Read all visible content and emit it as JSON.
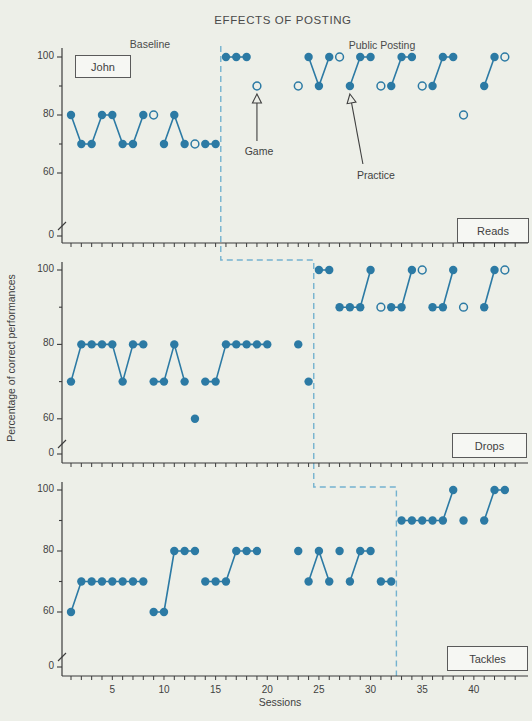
{
  "title": "EFFECTS OF POSTING",
  "subject_label": "John",
  "phase_labels": {
    "baseline": "Baseline",
    "posting": "Public Posting"
  },
  "annotations": {
    "game": "Game",
    "practice": "Practice"
  },
  "axis": {
    "xlabel": "Sessions",
    "ylabel": "Percentage of correct performances"
  },
  "panel_boxes": {
    "reads": "Reads",
    "drops": "Drops",
    "tackles": "Tackles"
  },
  "chart_data": {
    "type": "scatter",
    "title": "EFFECTS OF POSTING",
    "xlabel": "Sessions",
    "ylabel": "Percentage of correct performances",
    "x_tick_labels": [
      5,
      10,
      15,
      20,
      25,
      30,
      35,
      40
    ],
    "x_range": [
      1,
      44
    ],
    "y_tick_values": [
      100,
      90,
      80,
      70,
      60
    ],
    "y_axis_label_values": [
      100,
      80,
      60,
      0
    ],
    "y_axis_break": true,
    "legend": {
      "filled_marker": "session data point",
      "open_marker": "special condition session (game / practice noted)"
    },
    "colors": {
      "data": "#2c7aa4",
      "phase_line": "#74b2cf",
      "axis": "#3b3b3b",
      "text": "#3f3f3f",
      "background": "#edefe8"
    },
    "panels": [
      {
        "label": "Reads",
        "phase_change_after_session": 15.5,
        "segments": [
          [
            [
              1,
              80
            ],
            [
              2,
              70
            ],
            [
              3,
              70
            ],
            [
              4,
              80
            ],
            [
              5,
              80
            ],
            [
              6,
              70
            ],
            [
              7,
              70
            ],
            [
              8,
              80
            ]
          ],
          [
            [
              10,
              70
            ],
            [
              11,
              80
            ],
            [
              12,
              70
            ]
          ],
          [
            [
              14,
              70
            ],
            [
              15,
              70
            ]
          ],
          [
            [
              16,
              100
            ],
            [
              17,
              100
            ],
            [
              18,
              100
            ]
          ],
          [
            [
              24,
              100
            ],
            [
              25,
              90
            ],
            [
              26,
              100
            ]
          ],
          [
            [
              28,
              90
            ],
            [
              29,
              100
            ],
            [
              30,
              100
            ]
          ],
          [
            [
              32,
              90
            ],
            [
              33,
              100
            ],
            [
              34,
              100
            ]
          ],
          [
            [
              36,
              90
            ],
            [
              37,
              100
            ],
            [
              38,
              100
            ]
          ],
          [
            [
              41,
              90
            ],
            [
              42,
              100
            ]
          ]
        ],
        "isolated_filled": [],
        "open_points": [
          [
            9,
            80
          ],
          [
            13,
            70
          ],
          [
            19,
            90
          ],
          [
            23,
            90
          ],
          [
            27,
            100
          ],
          [
            31,
            90
          ],
          [
            35,
            90
          ],
          [
            39,
            80
          ],
          [
            43,
            100
          ]
        ],
        "annotations": [
          {
            "key": "game",
            "target": [
              19,
              90
            ]
          },
          {
            "key": "practice",
            "target": [
              28,
              90
            ]
          }
        ]
      },
      {
        "label": "Drops",
        "phase_change_after_session": 24.5,
        "segments": [
          [
            [
              1,
              70
            ],
            [
              2,
              80
            ],
            [
              3,
              80
            ],
            [
              4,
              80
            ],
            [
              5,
              80
            ],
            [
              6,
              70
            ],
            [
              7,
              80
            ],
            [
              8,
              80
            ]
          ],
          [
            [
              9,
              70
            ],
            [
              10,
              70
            ],
            [
              11,
              80
            ],
            [
              12,
              70
            ]
          ],
          [
            [
              14,
              70
            ],
            [
              15,
              70
            ],
            [
              16,
              80
            ],
            [
              17,
              80
            ],
            [
              18,
              80
            ],
            [
              19,
              80
            ],
            [
              20,
              80
            ]
          ],
          [
            [
              25,
              100
            ],
            [
              26,
              100
            ]
          ],
          [
            [
              27,
              90
            ],
            [
              28,
              90
            ],
            [
              29,
              90
            ],
            [
              30,
              100
            ]
          ],
          [
            [
              32,
              90
            ],
            [
              33,
              90
            ],
            [
              34,
              100
            ]
          ],
          [
            [
              36,
              90
            ],
            [
              37,
              90
            ],
            [
              38,
              100
            ]
          ],
          [
            [
              41,
              90
            ],
            [
              42,
              100
            ]
          ]
        ],
        "isolated_filled": [
          [
            13,
            60
          ],
          [
            23,
            80
          ],
          [
            24,
            70
          ]
        ],
        "open_points": [
          [
            31,
            90
          ],
          [
            35,
            100
          ],
          [
            39,
            90
          ],
          [
            43,
            100
          ]
        ],
        "annotations": []
      },
      {
        "label": "Tackles",
        "phase_change_after_session": 32.5,
        "segments": [
          [
            [
              1,
              60
            ],
            [
              2,
              70
            ],
            [
              3,
              70
            ],
            [
              4,
              70
            ],
            [
              5,
              70
            ],
            [
              6,
              70
            ],
            [
              7,
              70
            ],
            [
              8,
              70
            ]
          ],
          [
            [
              9,
              60
            ],
            [
              10,
              60
            ],
            [
              11,
              80
            ],
            [
              12,
              80
            ],
            [
              13,
              80
            ]
          ],
          [
            [
              14,
              70
            ],
            [
              15,
              70
            ],
            [
              16,
              70
            ],
            [
              17,
              80
            ],
            [
              18,
              80
            ],
            [
              19,
              80
            ]
          ],
          [
            [
              24,
              70
            ],
            [
              25,
              80
            ],
            [
              26,
              70
            ]
          ],
          [
            [
              28,
              70
            ],
            [
              29,
              80
            ],
            [
              30,
              80
            ]
          ],
          [
            [
              31,
              70
            ],
            [
              32,
              70
            ]
          ],
          [
            [
              33,
              90
            ],
            [
              34,
              90
            ],
            [
              35,
              90
            ],
            [
              36,
              90
            ],
            [
              37,
              90
            ],
            [
              38,
              100
            ]
          ],
          [
            [
              41,
              90
            ],
            [
              42,
              100
            ],
            [
              43,
              100
            ]
          ]
        ],
        "isolated_filled": [
          [
            23,
            80
          ],
          [
            27,
            80
          ],
          [
            39,
            90
          ]
        ],
        "open_points": [],
        "annotations": []
      }
    ]
  }
}
